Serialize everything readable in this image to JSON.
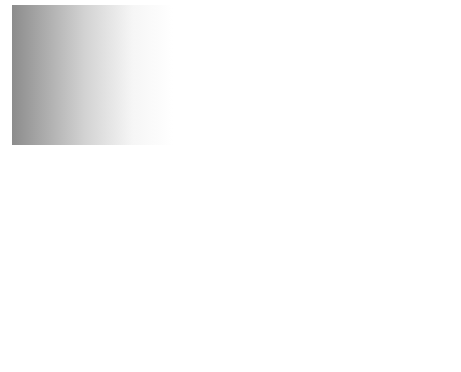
{
  "diagram": {
    "axes": {
      "vertical_label": "z",
      "horizontal_label": "r",
      "ticks": [
        "-a",
        "a"
      ]
    },
    "labels": {
      "top_pressure_prefix": "Pressure ",
      "top_pressure_symbol": "p",
      "top_pressure_sub": "2",
      "bottom_pressure_prefix": "Pressure ",
      "bottom_pressure_symbol": "p",
      "bottom_pressure_sub": "1",
      "length": "l"
    },
    "velocity_profile": {
      "shape": "parabolic",
      "arrow_count": 9
    },
    "colors": {
      "background_dark": "#8a8a8a",
      "background_light": "#ffffff",
      "line": "#1a1a1a",
      "label_line": "#555555"
    }
  }
}
